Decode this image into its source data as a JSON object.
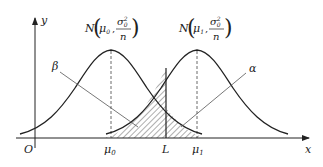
{
  "diagram": {
    "axes": {
      "x_label": "x",
      "y_label": "y",
      "origin_label": "O"
    },
    "distributions": [
      {
        "name": "null",
        "label_N": "N",
        "label_mean": "μ",
        "label_mean_sub": "0",
        "label_var_num": "σ",
        "label_var_sub": "0",
        "label_var_sup": "2",
        "label_var_den": "n",
        "axis_tick": "μ",
        "axis_tick_sub": "0"
      },
      {
        "name": "alternative",
        "label_N": "N",
        "label_mean": "μ",
        "label_mean_sub": "1",
        "label_var_num": "σ",
        "label_var_sub": "0",
        "label_var_sup": "2",
        "label_var_den": "n",
        "axis_tick": "μ",
        "axis_tick_sub": "1"
      }
    ],
    "critical_value_label": "L",
    "error_labels": {
      "beta": "β",
      "alpha": "α"
    },
    "colors": {
      "line": "#222222",
      "pointer": "#555555",
      "background": "#ffffff"
    }
  }
}
